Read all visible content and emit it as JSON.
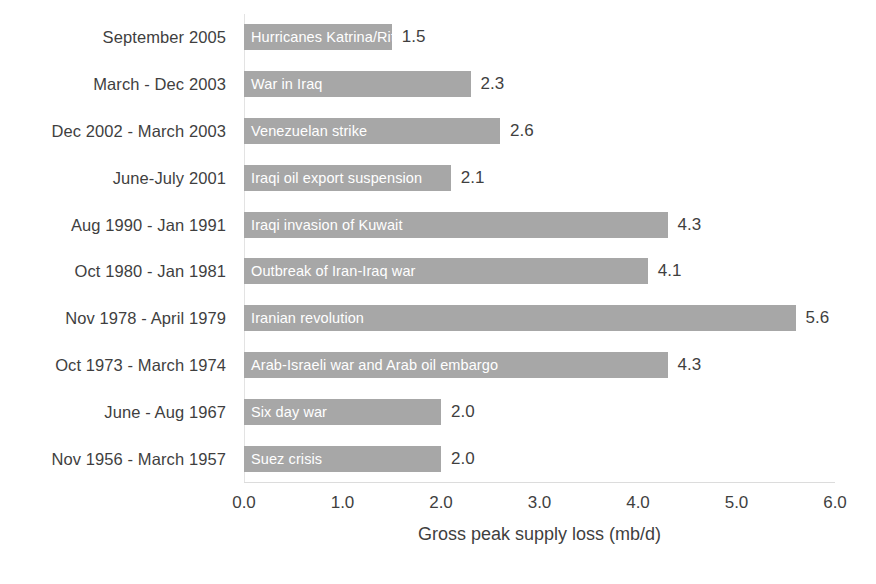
{
  "chart_data": {
    "type": "bar",
    "orientation": "horizontal",
    "title": "",
    "xlabel": "Gross peak supply loss (mb/d)",
    "ylabel": "",
    "xlim": [
      0.0,
      6.0
    ],
    "xticks": [
      "0.0",
      "1.0",
      "2.0",
      "3.0",
      "4.0",
      "5.0",
      "6.0"
    ],
    "xtick_values": [
      0.0,
      1.0,
      2.0,
      3.0,
      4.0,
      5.0,
      6.0
    ],
    "grid": false,
    "legend": "none",
    "bar_color": "#a7a7a7",
    "bar_label_color": "#ffffff",
    "text_color": "#3f3f3f",
    "categories": [
      "September 2005",
      "March - Dec 2003",
      "Dec 2002 - March 2003",
      "June-July 2001",
      "Aug 1990 - Jan 1991",
      "Oct 1980 - Jan 1981",
      "Nov 1978 - April 1979",
      "Oct 1973 - March 1974",
      "June - Aug 1967",
      "Nov 1956 - March 1957"
    ],
    "bar_labels": [
      "Hurricanes Katrina/Rita",
      "War in Iraq",
      "Venezuelan strike",
      "Iraqi oil export suspension",
      "Iraqi invasion of Kuwait",
      "Outbreak of Iran-Iraq war",
      "Iranian revolution",
      "Arab-Israeli war and Arab oil embargo",
      "Six day war",
      "Suez crisis"
    ],
    "values": [
      1.5,
      2.3,
      2.6,
      2.1,
      4.3,
      4.1,
      5.6,
      4.3,
      2.0,
      2.0
    ],
    "value_labels": [
      "1.5",
      "2.3",
      "2.6",
      "2.1",
      "4.3",
      "4.1",
      "5.6",
      "4.3",
      "2.0",
      "2.0"
    ]
  }
}
